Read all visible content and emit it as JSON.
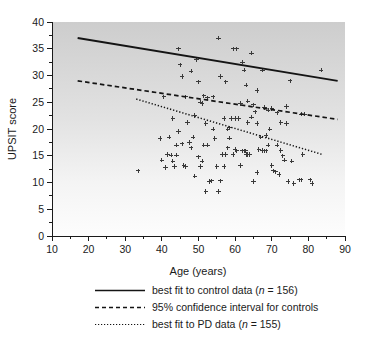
{
  "chart_data": {
    "type": "scatter",
    "title": "",
    "xlabel": "Age (years)",
    "ylabel": "UPSIT score",
    "xlim": [
      10,
      90
    ],
    "ylim": [
      0,
      40
    ],
    "xticks": [
      10,
      20,
      30,
      40,
      50,
      60,
      70,
      80,
      90
    ],
    "yticks": [
      0,
      5,
      10,
      15,
      20,
      25,
      30,
      35,
      40
    ],
    "xtick_labels": [
      "10",
      "20",
      "30",
      "40",
      "50",
      "60",
      "70",
      "80",
      "90"
    ],
    "ytick_labels": [
      "0",
      "5",
      "10",
      "15",
      "20",
      "25",
      "30",
      "35",
      "40"
    ],
    "grid": false,
    "legend_position": "below",
    "marker": "plus",
    "marker_color": "#3a3a3a",
    "background": {
      "type": "vertical-gradient",
      "top_color": "#cfcfcf",
      "bottom_color": "#fdfdfd"
    },
    "series": [
      {
        "name": "control data points",
        "type": "scatter",
        "points": [
          [
            44.5,
            35.0
          ],
          [
            45.0,
            32.0
          ],
          [
            45.5,
            29.8
          ],
          [
            46.5,
            26.0
          ],
          [
            48.0,
            30.8
          ],
          [
            49.5,
            33.0
          ],
          [
            50.0,
            28.8
          ],
          [
            50.5,
            25.0
          ],
          [
            51.0,
            24.8
          ],
          [
            51.5,
            26.2
          ],
          [
            52.5,
            25.8
          ],
          [
            54.0,
            26.0
          ],
          [
            55.5,
            37.0
          ],
          [
            56.0,
            29.8
          ],
          [
            57.5,
            28.8
          ],
          [
            59.5,
            35.0
          ],
          [
            60.5,
            35.0
          ],
          [
            61.5,
            24.8
          ],
          [
            62.0,
            32.5
          ],
          [
            62.5,
            31.0
          ],
          [
            63.0,
            28.2
          ],
          [
            63.5,
            25.2
          ],
          [
            64.5,
            34.2
          ],
          [
            65.0,
            24.5
          ],
          [
            66.0,
            27.2
          ],
          [
            67.5,
            31.0
          ],
          [
            68.0,
            24.0
          ],
          [
            69.0,
            23.5
          ],
          [
            70.0,
            23.8
          ],
          [
            71.5,
            23.0
          ],
          [
            72.5,
            21.2
          ],
          [
            74.0,
            24.2
          ],
          [
            75.0,
            29.0
          ],
          [
            78.0,
            22.8
          ],
          [
            83.5,
            31.0
          ],
          [
            49.0,
            22.5
          ],
          [
            52.0,
            21.0
          ],
          [
            58.0,
            20.0
          ],
          [
            58.5,
            20.2
          ],
          [
            60.0,
            22.0
          ],
          [
            61.0,
            22.0
          ],
          [
            63.5,
            21.2
          ],
          [
            66.0,
            21.0
          ],
          [
            68.5,
            18.8
          ],
          [
            43.0,
            22.0
          ],
          [
            40.5,
            26.0
          ]
        ]
      },
      {
        "name": "PD data points",
        "type": "scatter",
        "points": [
          [
            33.5,
            12.2
          ],
          [
            39.5,
            18.2
          ],
          [
            40.0,
            14.2
          ],
          [
            41.0,
            12.8
          ],
          [
            41.5,
            15.2
          ],
          [
            42.0,
            18.5
          ],
          [
            42.5,
            15.1
          ],
          [
            43.0,
            14.0
          ],
          [
            44.0,
            17.0
          ],
          [
            44.5,
            19.5
          ],
          [
            45.5,
            17.2
          ],
          [
            46.0,
            13.2
          ],
          [
            46.5,
            13.0
          ],
          [
            47.0,
            21.2
          ],
          [
            47.5,
            17.5
          ],
          [
            48.0,
            16.5
          ],
          [
            48.5,
            18.5
          ],
          [
            49.0,
            11.2
          ],
          [
            50.0,
            14.8
          ],
          [
            50.5,
            13.0
          ],
          [
            51.0,
            14.0
          ],
          [
            52.0,
            8.3
          ],
          [
            53.0,
            10.2
          ],
          [
            53.5,
            10.3
          ],
          [
            54.0,
            20.0
          ],
          [
            54.5,
            18.2
          ],
          [
            55.0,
            13.0
          ],
          [
            55.5,
            8.3
          ],
          [
            56.0,
            10.3
          ],
          [
            56.5,
            15.2
          ],
          [
            57.0,
            22.0
          ],
          [
            57.5,
            15.2
          ],
          [
            58.0,
            16.5
          ],
          [
            58.5,
            18.3
          ],
          [
            59.0,
            22.0
          ],
          [
            59.5,
            15.2
          ],
          [
            60.0,
            16.2
          ],
          [
            60.5,
            15.9
          ],
          [
            61.0,
            22.0
          ],
          [
            61.5,
            13.2
          ],
          [
            62.0,
            15.9
          ],
          [
            62.5,
            15.9
          ],
          [
            62.8,
            15.9
          ],
          [
            63.0,
            15.2
          ],
          [
            63.5,
            15.2
          ],
          [
            64.0,
            15.2
          ],
          [
            64.5,
            22.2
          ],
          [
            65.0,
            10.2
          ],
          [
            65.5,
            23.2
          ],
          [
            66.0,
            11.9
          ],
          [
            66.5,
            16.2
          ],
          [
            67.0,
            18.5
          ],
          [
            67.5,
            16.0
          ],
          [
            68.0,
            15.9
          ],
          [
            68.5,
            15.9
          ],
          [
            69.0,
            17.0
          ],
          [
            69.5,
            20.0
          ],
          [
            70.0,
            13.2
          ],
          [
            70.5,
            12.2
          ],
          [
            71.0,
            12.0
          ],
          [
            71.5,
            17.0
          ],
          [
            72.0,
            11.5
          ],
          [
            72.5,
            16.0
          ],
          [
            73.0,
            15.0
          ],
          [
            73.5,
            14.2
          ],
          [
            74.0,
            21.0
          ],
          [
            74.5,
            10.2
          ],
          [
            75.5,
            14.0
          ],
          [
            76.0,
            9.8
          ],
          [
            77.5,
            10.5
          ],
          [
            78.0,
            10.5
          ],
          [
            78.5,
            15.2
          ],
          [
            79.0,
            22.8
          ],
          [
            80.5,
            10.5
          ],
          [
            81.0,
            9.8
          ],
          [
            43.5,
            13.0
          ],
          [
            44.0,
            15.1
          ],
          [
            51.5,
            17.0
          ],
          [
            52.5,
            17.0
          ],
          [
            57.0,
            13.0
          ]
        ]
      }
    ],
    "fit_lines": [
      {
        "name": "best fit to control data",
        "style": "solid",
        "x": [
          17,
          88
        ],
        "y": [
          37.0,
          29.0
        ]
      },
      {
        "name": "95% confidence interval for controls",
        "style": "dashed",
        "x": [
          17,
          88
        ],
        "y": [
          29.0,
          21.8
        ]
      },
      {
        "name": "best fit to PD data",
        "style": "dotted",
        "x": [
          33,
          84
        ],
        "y": [
          25.6,
          15.2
        ]
      }
    ]
  },
  "legend": {
    "items": [
      {
        "style": "solid",
        "label": "best fit to control data (",
        "italic": "n",
        "label_tail": " = 156)"
      },
      {
        "style": "dashed",
        "label": "95% confidence interval for controls",
        "italic": "",
        "label_tail": ""
      },
      {
        "style": "dotted",
        "label": "best fit to PD data (",
        "italic": "n",
        "label_tail": " = 155)"
      }
    ]
  }
}
